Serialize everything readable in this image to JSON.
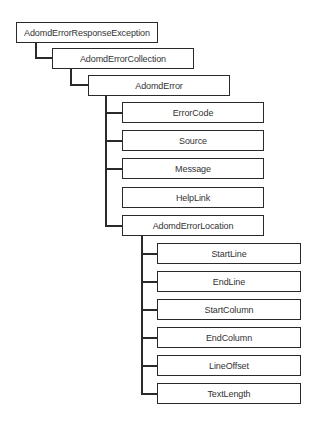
{
  "diagram": {
    "type": "class-hierarchy-tree",
    "nodes": {
      "response_exception": "AdomdErrorResponseException",
      "error_collection": "AdomdErrorCollection",
      "error": "AdomdError",
      "error_code": "ErrorCode",
      "source": "Source",
      "message": "Message",
      "help_link": "HelpLink",
      "error_location": "AdomdErrorLocation",
      "start_line": "StartLine",
      "end_line": "EndLine",
      "start_column": "StartColumn",
      "end_column": "EndColumn",
      "line_offset": "LineOffset",
      "text_length": "TextLength"
    },
    "edges": [
      [
        "AdomdErrorResponseException",
        "AdomdErrorCollection"
      ],
      [
        "AdomdErrorCollection",
        "AdomdError"
      ],
      [
        "AdomdError",
        "ErrorCode"
      ],
      [
        "AdomdError",
        "Source"
      ],
      [
        "AdomdError",
        "Message"
      ],
      [
        "AdomdError",
        "HelpLink"
      ],
      [
        "AdomdError",
        "AdomdErrorLocation"
      ],
      [
        "AdomdErrorLocation",
        "StartLine"
      ],
      [
        "AdomdErrorLocation",
        "EndLine"
      ],
      [
        "AdomdErrorLocation",
        "StartColumn"
      ],
      [
        "AdomdErrorLocation",
        "EndColumn"
      ],
      [
        "AdomdErrorLocation",
        "LineOffset"
      ],
      [
        "AdomdErrorLocation",
        "TextLength"
      ]
    ],
    "colors": {
      "line": "#2a2a2a",
      "text": "#333333",
      "background": "#ffffff"
    }
  }
}
